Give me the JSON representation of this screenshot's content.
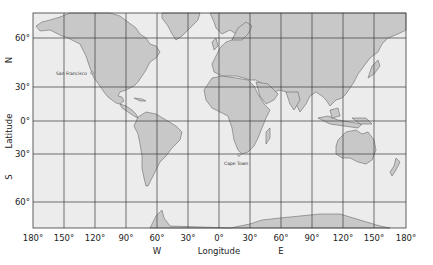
{
  "map": {
    "type": "world-map-graticule",
    "projection": "Mercator",
    "colors": {
      "ocean": "#ececec",
      "land": "#c8c8c8",
      "coast": "#555555",
      "grid": "#3a3a3a",
      "background": "#ffffff"
    },
    "y_axis": {
      "title": "Latitude",
      "north_label": "N",
      "south_label": "S",
      "ticks": [
        "60°",
        "30°",
        "0°",
        "30°",
        "60°"
      ]
    },
    "x_axis": {
      "title": "Longitude",
      "west_label": "W",
      "east_label": "E",
      "ticks": [
        "180°",
        "150°",
        "120°",
        "90°",
        "60°",
        "30°",
        "0°",
        "30°",
        "60°",
        "90°",
        "120°",
        "150°",
        "180°"
      ]
    },
    "cities": [
      {
        "name": "San Francisco",
        "lat": 37.8,
        "lon": -122.4
      },
      {
        "name": "Cape Town",
        "lat": -33.9,
        "lon": 18.4
      }
    ]
  }
}
